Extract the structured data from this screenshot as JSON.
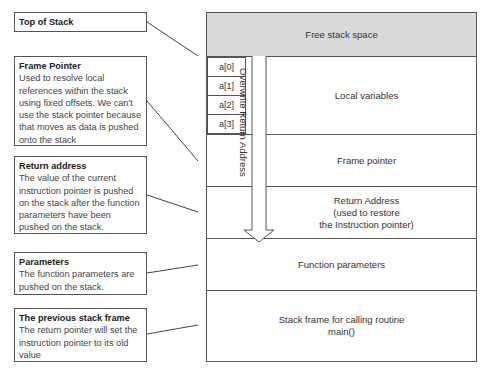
{
  "callouts": [
    {
      "title": "Top of Stack",
      "text": ""
    },
    {
      "title": "Frame Pointer",
      "text": "Used to resolve local references within the stack using fixed offsets. We can't use the stack pointer because that moves as data is pushed onto the stack"
    },
    {
      "title": "Return address",
      "text": "The value of the current instruction pointer is pushed on the stack after the function parameters have been pushed on the stack."
    },
    {
      "title": "Parameters",
      "text": "The function parameters are pushed on the stack."
    },
    {
      "title": "The previous stack frame",
      "text": "The return pointer will set the instruction pointer to its old value"
    }
  ],
  "stack": {
    "rows": [
      {
        "label": "Free stack space"
      },
      {
        "label": "Local variables"
      },
      {
        "label": "Frame pointer"
      },
      {
        "label": "Return Address\n(used to restore\nthe Instruction pointer)"
      },
      {
        "label": "Function parameters"
      },
      {
        "label": "Stack frame for calling routine\nmain()"
      }
    ],
    "array_cells": [
      "a[0]",
      "a[1]",
      "a[2]",
      "a[3]"
    ],
    "overwrite_arrow_label": "Overwrite Return Address"
  },
  "colors": {
    "free_space": "#dadada",
    "border": "#555555"
  }
}
